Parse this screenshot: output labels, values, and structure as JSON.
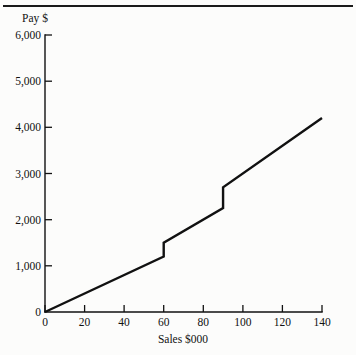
{
  "figure": {
    "background_color": "#fcfcfb",
    "line_color": "#111111",
    "has_top_rule": true
  },
  "chart_data": {
    "type": "line",
    "title": "",
    "subtitle": "",
    "xlabel": "Sales $000",
    "ylabel": "Pay $",
    "xlim": [
      0,
      140
    ],
    "ylim": [
      0,
      6000
    ],
    "grid": false,
    "legend": null,
    "xticks": [
      0,
      20,
      40,
      60,
      80,
      100,
      120,
      140
    ],
    "xticklabels": [
      "0",
      "20",
      "40",
      "60",
      "80",
      "100",
      "120",
      "140"
    ],
    "yticks": [
      0,
      1000,
      2000,
      3000,
      4000,
      5000,
      6000
    ],
    "yticklabels": [
      "0",
      "1,000",
      "2,000",
      "3,000",
      "4,000",
      "5,000",
      "6,000"
    ],
    "series": [
      {
        "name": "Pay",
        "x": [
          0,
          60,
          60,
          90,
          90,
          140
        ],
        "values": [
          0,
          1200,
          1500,
          2250,
          2700,
          4200
        ]
      }
    ],
    "segments": [
      {
        "x_start": 0,
        "y_start": 0,
        "x_end": 60,
        "y_end": 1200
      },
      {
        "x_start": 60,
        "y_start": 1200,
        "x_end": 60,
        "y_end": 1500
      },
      {
        "x_start": 60,
        "y_start": 1500,
        "x_end": 90,
        "y_end": 2250
      },
      {
        "x_start": 90,
        "y_start": 2250,
        "x_end": 90,
        "y_end": 2700
      },
      {
        "x_start": 90,
        "y_start": 2700,
        "x_end": 140,
        "y_end": 4200
      }
    ]
  }
}
